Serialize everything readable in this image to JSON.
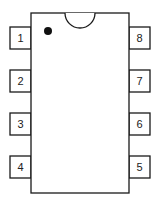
{
  "diagram": {
    "type": "ic-package-pinout",
    "package": "8-pin DIP",
    "colors": {
      "line": "#1a1a1a",
      "background": "#ffffff",
      "text": "#222222"
    },
    "body": {
      "x": 31,
      "y": 13,
      "width": 98,
      "height": 180
    },
    "notch": {
      "cx": 80,
      "cy": 13,
      "r": 15
    },
    "pin1_marker": {
      "cx": 48,
      "cy": 31,
      "r": 4
    },
    "pins_left": [
      {
        "label": "1",
        "x": 10,
        "y": 27
      },
      {
        "label": "2",
        "x": 10,
        "y": 70
      },
      {
        "label": "3",
        "x": 10,
        "y": 113
      },
      {
        "label": "4",
        "x": 10,
        "y": 156
      }
    ],
    "pins_right": [
      {
        "label": "8",
        "x": 129,
        "y": 27
      },
      {
        "label": "7",
        "x": 129,
        "y": 70
      },
      {
        "label": "6",
        "x": 129,
        "y": 113
      },
      {
        "label": "5",
        "x": 129,
        "y": 156
      }
    ],
    "pin_size": {
      "width": 21,
      "height": 22
    }
  }
}
